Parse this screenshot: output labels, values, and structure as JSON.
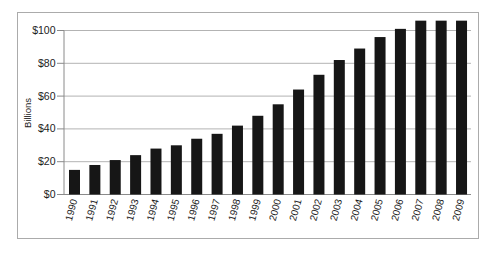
{
  "chart_data": {
    "type": "bar",
    "title": "",
    "xlabel": "",
    "ylabel": "Billions",
    "categories": [
      "1990",
      "1991",
      "1992",
      "1993",
      "1994",
      "1995",
      "1996",
      "1997",
      "1998",
      "1999",
      "2000",
      "2001",
      "2002",
      "2003",
      "2004",
      "2005",
      "2006",
      "2007",
      "2008",
      "2009"
    ],
    "values": [
      15,
      18,
      21,
      24,
      28,
      30,
      34,
      37,
      42,
      48,
      55,
      64,
      73,
      82,
      89,
      96,
      101,
      106,
      106,
      106
    ],
    "y_ticks": [
      0,
      20,
      40,
      60,
      80,
      100
    ],
    "y_tick_labels": [
      "$0",
      "$20",
      "$40",
      "$60",
      "$80",
      "$100"
    ],
    "ylim": [
      0,
      111
    ],
    "grid": "horizontal",
    "legend": "none",
    "colors": {
      "bar": "#161616",
      "gridline": "#b3b3b3",
      "axis": "#8a8a8a",
      "frame_border": "#ababab",
      "text": "#1c1c1c",
      "background": "#ffffff"
    }
  }
}
